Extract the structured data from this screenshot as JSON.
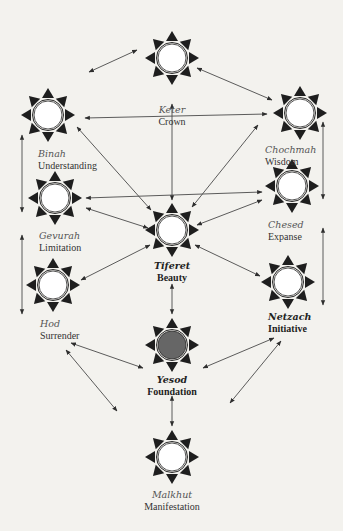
{
  "diagram": {
    "type": "tree-of-life",
    "colors": {
      "background": "#f3f2ee",
      "ray": "#1e1e1e",
      "ring": "#2a2a2a",
      "circle_fill": "#ffffff",
      "highlight_fill": "#666666",
      "arrow": "#4a4a4a"
    },
    "nodes": [
      {
        "id": "keter",
        "hebrew": "Keter",
        "english": "Crown",
        "cx": 172,
        "cy": 58,
        "highlight": false,
        "bold": false
      },
      {
        "id": "binah",
        "hebrew": "Binah",
        "english": "Understanding",
        "cx": 48,
        "cy": 115,
        "highlight": false,
        "bold": false
      },
      {
        "id": "chochmah",
        "hebrew": "Chochmah",
        "english": "Wisdom",
        "cx": 300,
        "cy": 113,
        "highlight": false,
        "bold": false
      },
      {
        "id": "gevurah",
        "hebrew": "Gevurah",
        "english": "Limitation",
        "cx": 55,
        "cy": 198,
        "highlight": false,
        "bold": false
      },
      {
        "id": "chesed",
        "hebrew": "Chesed",
        "english": "Expanse",
        "cx": 292,
        "cy": 186,
        "highlight": false,
        "bold": false
      },
      {
        "id": "tiferet",
        "hebrew": "Tiferet",
        "english": "Beauty",
        "cx": 172,
        "cy": 230,
        "highlight": false,
        "bold": true
      },
      {
        "id": "hod",
        "hebrew": "Hod",
        "english": "Surrender",
        "cx": 53,
        "cy": 285,
        "highlight": false,
        "bold": false
      },
      {
        "id": "netzach",
        "hebrew": "Netzach",
        "english": "Initiative",
        "cx": 288,
        "cy": 282,
        "highlight": false,
        "bold": true
      },
      {
        "id": "yesod",
        "hebrew": "Yesod",
        "english": "Foundation",
        "cx": 172,
        "cy": 345,
        "highlight": true,
        "bold": true
      },
      {
        "id": "malkhut",
        "hebrew": "Malkhut",
        "english": "Manifestation",
        "cx": 172,
        "cy": 457,
        "highlight": false,
        "bold": false
      }
    ],
    "connections": [
      {
        "from": "keter",
        "to": "binah",
        "x1": 89,
        "y1": 72,
        "x2": 137,
        "y2": 50
      },
      {
        "from": "keter",
        "to": "chochmah",
        "x1": 197,
        "y1": 68,
        "x2": 272,
        "y2": 100
      },
      {
        "from": "binah",
        "to": "chochmah",
        "x1": 85,
        "y1": 118,
        "x2": 267,
        "y2": 114
      },
      {
        "from": "keter",
        "to": "tiferet",
        "x1": 172,
        "y1": 104,
        "x2": 172,
        "y2": 200
      },
      {
        "from": "binah",
        "to": "tiferet",
        "x1": 77,
        "y1": 127,
        "x2": 151,
        "y2": 210
      },
      {
        "from": "chochmah",
        "to": "tiferet",
        "x1": 258,
        "y1": 125,
        "x2": 192,
        "y2": 207
      },
      {
        "from": "gevurah",
        "to": "chesed",
        "x1": 86,
        "y1": 198,
        "x2": 262,
        "y2": 192
      },
      {
        "from": "gevurah",
        "to": "tiferet",
        "x1": 86,
        "y1": 208,
        "x2": 148,
        "y2": 228
      },
      {
        "from": "chesed",
        "to": "tiferet",
        "x1": 262,
        "y1": 200,
        "x2": 197,
        "y2": 225
      },
      {
        "from": "tiferet",
        "to": "hod",
        "x1": 150,
        "y1": 245,
        "x2": 81,
        "y2": 280
      },
      {
        "from": "tiferet",
        "to": "netzach",
        "x1": 195,
        "y1": 245,
        "x2": 260,
        "y2": 276
      },
      {
        "from": "tiferet",
        "to": "yesod",
        "x1": 172,
        "y1": 284,
        "x2": 172,
        "y2": 314
      },
      {
        "from": "binah",
        "to": "gevurah",
        "x1": 22,
        "y1": 135,
        "x2": 22,
        "y2": 212
      },
      {
        "from": "gevurah",
        "to": "hod",
        "x1": 22,
        "y1": 235,
        "x2": 22,
        "y2": 314
      },
      {
        "from": "chochmah",
        "to": "chesed",
        "x1": 323,
        "y1": 122,
        "x2": 323,
        "y2": 199
      },
      {
        "from": "chesed",
        "to": "netzach",
        "x1": 323,
        "y1": 228,
        "x2": 323,
        "y2": 305
      },
      {
        "from": "hod",
        "to": "yesod",
        "x1": 71,
        "y1": 343,
        "x2": 143,
        "y2": 368
      },
      {
        "from": "netzach",
        "to": "yesod",
        "x1": 274,
        "y1": 338,
        "x2": 203,
        "y2": 368
      },
      {
        "from": "hod",
        "to": "malkhut",
        "x1": 66,
        "y1": 350,
        "x2": 117,
        "y2": 411
      },
      {
        "from": "netzach",
        "to": "malkhut",
        "x1": 281,
        "y1": 341,
        "x2": 230,
        "y2": 403
      },
      {
        "from": "yesod",
        "to": "malkhut",
        "x1": 172,
        "y1": 396,
        "x2": 172,
        "y2": 426
      }
    ]
  }
}
